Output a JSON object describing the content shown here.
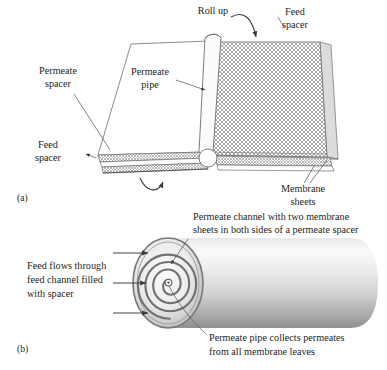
{
  "figure": {
    "background_color": "#ffffff",
    "ink_color": "#231f20",
    "line_color": "#58595b",
    "mesh_color": "#8d8f92",
    "cylinder_light": "#f2f2f2",
    "cylinder_dark": "#8a8c8e"
  },
  "panel_a": {
    "tag": "(a)",
    "labels": {
      "permeate_spacer": {
        "line1": "Permeate",
        "line2": "spacer"
      },
      "permeate_pipe": {
        "line1": "Permeate",
        "line2": "pipe"
      },
      "feed_spacer_top": {
        "line1": "Feed",
        "line2": "spacer"
      },
      "feed_spacer_left": {
        "line1": "Feed",
        "line2": "spacer"
      },
      "membrane_sheets": {
        "line1": "Membrane",
        "line2": "sheets"
      },
      "roll_up": "Roll up"
    }
  },
  "panel_b": {
    "tag": "(b)",
    "labels": {
      "permeate_channel": {
        "line1": "Permeate channel with two membrane",
        "line2": "sheets in both sides of a permeate spacer"
      },
      "feed_flows": {
        "line1": "Feed flows through",
        "line2": "feed channel filled",
        "line3": "with spacer"
      },
      "permeate_pipe_collects": {
        "line1": "Permeate pipe collects permeates",
        "line2": "from all membrane leaves"
      }
    },
    "spiral": {
      "turns": 4,
      "arrow_count": 3
    }
  }
}
